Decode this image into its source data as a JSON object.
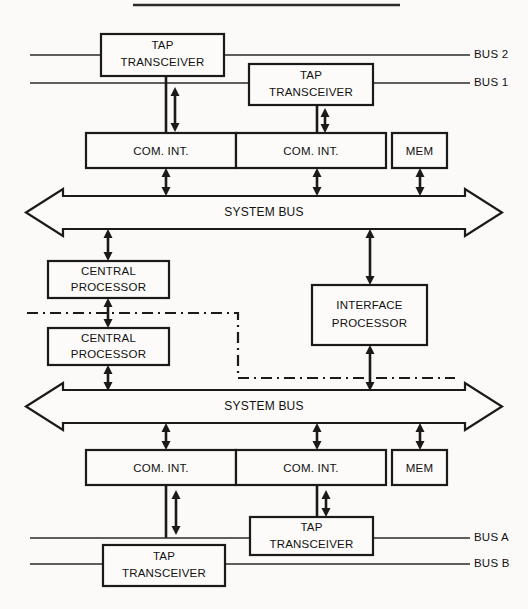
{
  "figure": {
    "type": "block-diagram",
    "title_rule_visible": true,
    "background_color": "#fbfaf8",
    "line_color": "#1a1a1a"
  },
  "labels": {
    "tap_transceiver": "TAP\nTRANSCEIVER",
    "tap_line1": "TAP",
    "tap_line2": "TRANSCEIVER",
    "com_int": "COM.  INT.",
    "mem": "MEM",
    "system_bus": "SYSTEM BUS",
    "central_processor_line1": "CENTRAL",
    "central_processor_line2": "PROCESSOR",
    "interface_processor_line1": "INTERFACE",
    "interface_processor_line2": "PROCESSOR",
    "bus_2": "BUS 2",
    "bus_1": "BUS 1",
    "bus_a": "BUS A",
    "bus_b": "BUS B"
  },
  "top_section": {
    "tap_transceivers": [
      {
        "id": "tap-top-left",
        "line1": "TAP",
        "line2": "TRANSCEIVER",
        "attached_bus": "BUS 2"
      },
      {
        "id": "tap-top-right",
        "line1": "TAP",
        "line2": "TRANSCEIVER",
        "attached_bus": "BUS 1"
      }
    ],
    "com_ints": [
      {
        "id": "com-int-top-left",
        "label": "COM.  INT."
      },
      {
        "id": "com-int-top-right",
        "label": "COM.  INT."
      }
    ],
    "mem": {
      "id": "mem-top",
      "label": "MEM"
    },
    "bus_labels": [
      {
        "id": "bus-2",
        "label": "BUS 2"
      },
      {
        "id": "bus-1",
        "label": "BUS 1"
      }
    ],
    "system_bus": {
      "id": "system-bus-top",
      "label": "SYSTEM BUS"
    }
  },
  "middle_section": {
    "central_processors": [
      {
        "id": "central-processor-upper",
        "line1": "CENTRAL",
        "line2": "PROCESSOR"
      },
      {
        "id": "central-processor-lower",
        "line1": "CENTRAL",
        "line2": "PROCESSOR"
      }
    ],
    "interface_processor": {
      "id": "interface-processor",
      "line1": "INTERFACE",
      "line2": "PROCESSOR"
    },
    "dash_dot_links": [
      {
        "id": "dashdot-upper",
        "description": "horizontal dash-dot link crossing the central processors"
      },
      {
        "id": "dashdot-lower",
        "description": "horizontal dash-dot link crossing the interface processor"
      }
    ]
  },
  "bottom_section": {
    "system_bus": {
      "id": "system-bus-bottom",
      "label": "SYSTEM BUS"
    },
    "com_ints": [
      {
        "id": "com-int-bottom-left",
        "label": "COM.  INT."
      },
      {
        "id": "com-int-bottom-right",
        "label": "COM.  INT."
      }
    ],
    "mem": {
      "id": "mem-bottom",
      "label": "MEM"
    },
    "tap_transceivers": [
      {
        "id": "tap-bottom-right",
        "line1": "TAP",
        "line2": "TRANSCEIVER",
        "attached_bus": "BUS A"
      },
      {
        "id": "tap-bottom-left",
        "line1": "TAP",
        "line2": "TRANSCEIVER",
        "attached_bus": "BUS B"
      }
    ],
    "bus_labels": [
      {
        "id": "bus-a",
        "label": "BUS A"
      },
      {
        "id": "bus-b",
        "label": "BUS B"
      }
    ]
  }
}
